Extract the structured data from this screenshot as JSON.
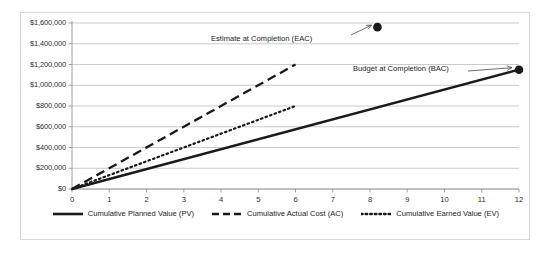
{
  "chart_data": {
    "type": "line",
    "title": "",
    "xlabel": "",
    "ylabel": "",
    "xlim": [
      0,
      12
    ],
    "ylim": [
      0,
      1600000
    ],
    "grid": true,
    "legend_position": "bottom",
    "x_ticks": [
      "0",
      "1",
      "2",
      "3",
      "4",
      "5",
      "6",
      "7",
      "8",
      "9",
      "10",
      "11",
      "12"
    ],
    "y_ticks": [
      "$0",
      "$200,000",
      "$400,000",
      "$600,000",
      "$800,000",
      "$1,000,000",
      "$1,200,000",
      "$1,400,000",
      "$1,600,000"
    ],
    "y_tick_values": [
      0,
      200000,
      400000,
      600000,
      800000,
      1000000,
      1200000,
      1400000,
      1600000
    ],
    "series": [
      {
        "name": "Cumulative Planned Value (PV)",
        "style": "solid",
        "color": "#1a1a1a",
        "x": [
          0,
          12
        ],
        "values": [
          0,
          1150000
        ]
      },
      {
        "name": "Cumulative Actual Cost (AC)",
        "style": "dashed",
        "color": "#1a1a1a",
        "x": [
          0,
          6
        ],
        "values": [
          0,
          1200000
        ]
      },
      {
        "name": "Cumulative Earned Value (EV)",
        "style": "dotted",
        "color": "#1a1a1a",
        "x": [
          0,
          6
        ],
        "values": [
          0,
          800000
        ]
      }
    ],
    "markers": [
      {
        "name": "Estimate at Completion (EAC)",
        "x": 8.2,
        "y": 1560000,
        "label": "Estimate at Completion (EAC)"
      },
      {
        "name": "Budget at Completion (BAC)",
        "x": 12,
        "y": 1150000,
        "label": "Budget at Completion (BAC)"
      }
    ],
    "annotations": [
      {
        "text": "Estimate at Completion (EAC)",
        "target": "eac-marker"
      },
      {
        "text": "Budget at Completion (BAC)",
        "target": "bac-marker"
      }
    ]
  },
  "yaxis": {
    "labels": [
      "$1,600,000",
      "$1,400,000",
      "$1,200,000",
      "$1,000,000",
      "$800,000",
      "$600,000",
      "$400,000",
      "$200,000",
      "$0"
    ]
  },
  "xaxis": {
    "labels": [
      "0",
      "1",
      "2",
      "3",
      "4",
      "5",
      "6",
      "7",
      "8",
      "9",
      "10",
      "11",
      "12"
    ]
  },
  "annotations": {
    "eac": "Estimate at Completion (EAC)",
    "bac": "Budget at Completion (BAC)"
  },
  "legend": {
    "items": [
      {
        "label": "Cumulative Planned Value (PV)",
        "style": "solid"
      },
      {
        "label": "Cumulative Actual Cost (AC)",
        "style": "dashed"
      },
      {
        "label": "Cumulative Earned Value (EV)",
        "style": "dotted"
      }
    ]
  },
  "colors": {
    "ink": "#1a1a1a",
    "gridline": "#b4b4b4",
    "axis": "#8c8c8c",
    "frame": "#d8d8d8",
    "background": "#ffffff"
  }
}
